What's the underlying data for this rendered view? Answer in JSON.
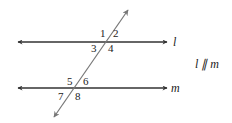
{
  "diagram": {
    "colors": {
      "parallel_lines": "#333333",
      "transversal": "#777777",
      "text": "#222222",
      "background": "#ffffff"
    },
    "lines": {
      "l": {
        "label": "l",
        "y": 42,
        "x1": 18,
        "x2": 167
      },
      "m": {
        "label": "m",
        "y": 88,
        "x1": 18,
        "x2": 167
      },
      "transversal": {
        "x1": 128,
        "y1": 10,
        "x2": 54,
        "y2": 117
      }
    },
    "relation": "l ∥ m",
    "angles": [
      {
        "label": "1",
        "x": 100,
        "y": 37
      },
      {
        "label": "2",
        "x": 113,
        "y": 37
      },
      {
        "label": "3",
        "x": 91,
        "y": 52
      },
      {
        "label": "4",
        "x": 108,
        "y": 52
      },
      {
        "label": "5",
        "x": 67,
        "y": 85
      },
      {
        "label": "6",
        "x": 83,
        "y": 85
      },
      {
        "label": "7",
        "x": 58,
        "y": 100
      },
      {
        "label": "8",
        "x": 75,
        "y": 100
      }
    ]
  }
}
